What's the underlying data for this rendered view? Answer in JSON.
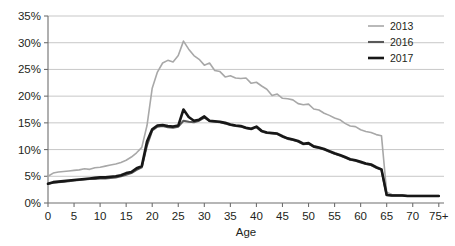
{
  "chart_data": {
    "type": "line",
    "title": "",
    "xlabel": "Age",
    "ylabel": "",
    "xlim": [
      0,
      76
    ],
    "ylim": [
      0,
      35
    ],
    "grid": true,
    "legend_position": "top-right",
    "y_ticks": [
      "0%",
      "5%",
      "10%",
      "15%",
      "20%",
      "25%",
      "30%",
      "35%"
    ],
    "y_tick_values": [
      0,
      5,
      10,
      15,
      20,
      25,
      30,
      35
    ],
    "x_ticks": [
      "0",
      "5",
      "10",
      "15",
      "20",
      "25",
      "30",
      "35",
      "40",
      "45",
      "50",
      "55",
      "60",
      "65",
      "70",
      "75+"
    ],
    "x_tick_values": [
      0,
      5,
      10,
      15,
      20,
      25,
      30,
      35,
      40,
      45,
      50,
      55,
      60,
      65,
      70,
      75
    ],
    "x": [
      0,
      1,
      2,
      3,
      4,
      5,
      6,
      7,
      8,
      9,
      10,
      11,
      12,
      13,
      14,
      15,
      16,
      17,
      18,
      19,
      20,
      21,
      22,
      23,
      24,
      25,
      26,
      27,
      28,
      29,
      30,
      31,
      32,
      33,
      34,
      35,
      36,
      37,
      38,
      39,
      40,
      41,
      42,
      43,
      44,
      45,
      46,
      47,
      48,
      49,
      50,
      51,
      52,
      53,
      54,
      55,
      56,
      57,
      58,
      59,
      60,
      61,
      62,
      63,
      64,
      65,
      66,
      67,
      68,
      69,
      70,
      71,
      72,
      73,
      74,
      75
    ],
    "series": [
      {
        "name": "2013",
        "color": "#a8a8a8",
        "width": 1.6,
        "values": [
          5.0,
          5.6,
          5.8,
          5.9,
          6.0,
          6.1,
          6.2,
          6.4,
          6.3,
          6.6,
          6.7,
          6.9,
          7.1,
          7.3,
          7.6,
          8.0,
          8.6,
          9.4,
          10.4,
          14.5,
          21.5,
          24.5,
          26.2,
          26.7,
          26.4,
          27.6,
          30.3,
          28.8,
          27.6,
          26.9,
          25.8,
          26.2,
          24.8,
          24.6,
          23.6,
          23.8,
          23.4,
          23.3,
          23.4,
          22.4,
          22.6,
          21.9,
          21.3,
          20.1,
          20.4,
          19.6,
          19.5,
          19.3,
          18.6,
          18.4,
          18.5,
          17.6,
          17.4,
          16.8,
          16.4,
          15.9,
          15.6,
          14.9,
          14.4,
          14.3,
          13.7,
          13.4,
          13.2,
          12.8,
          12.6,
          2.0,
          1.6,
          1.5,
          1.5,
          1.4,
          1.4,
          1.4,
          1.4,
          1.4,
          1.4,
          1.4
        ]
      },
      {
        "name": "2016",
        "color": "#595959",
        "width": 2.1,
        "values": [
          3.6,
          3.8,
          3.9,
          4.0,
          4.1,
          4.2,
          4.3,
          4.4,
          4.5,
          4.5,
          4.6,
          4.6,
          4.7,
          4.8,
          5.0,
          5.3,
          5.6,
          6.2,
          6.7,
          10.8,
          13.6,
          14.3,
          14.4,
          14.2,
          14.1,
          14.3,
          15.4,
          15.2,
          15.1,
          15.4,
          16.0,
          15.3,
          15.2,
          15.1,
          14.9,
          14.6,
          14.4,
          14.3,
          14.0,
          13.8,
          14.2,
          13.4,
          13.1,
          13.0,
          12.9,
          12.4,
          12.0,
          11.8,
          11.5,
          11.0,
          11.1,
          10.5,
          10.3,
          10.0,
          9.6,
          9.2,
          8.9,
          8.5,
          8.1,
          7.9,
          7.6,
          7.3,
          7.1,
          6.6,
          6.2,
          1.5,
          1.4,
          1.4,
          1.4,
          1.3,
          1.3,
          1.3,
          1.3,
          1.3,
          1.3,
          1.3
        ]
      },
      {
        "name": "2017",
        "color": "#171717",
        "width": 2.6,
        "values": [
          3.6,
          3.9,
          4.0,
          4.1,
          4.2,
          4.3,
          4.4,
          4.5,
          4.6,
          4.7,
          4.8,
          4.8,
          4.9,
          5.0,
          5.2,
          5.6,
          5.8,
          6.5,
          6.9,
          11.5,
          13.8,
          14.5,
          14.6,
          14.4,
          14.3,
          14.5,
          17.5,
          16.1,
          15.4,
          15.6,
          16.2,
          15.4,
          15.3,
          15.2,
          15.0,
          14.7,
          14.5,
          14.4,
          14.1,
          13.9,
          14.3,
          13.5,
          13.2,
          13.1,
          13.0,
          12.5,
          12.1,
          11.9,
          11.6,
          11.1,
          11.2,
          10.6,
          10.4,
          10.1,
          9.7,
          9.3,
          9.0,
          8.6,
          8.2,
          8.0,
          7.7,
          7.4,
          7.2,
          6.7,
          6.3,
          1.5,
          1.4,
          1.4,
          1.4,
          1.3,
          1.3,
          1.3,
          1.3,
          1.3,
          1.3,
          1.3
        ]
      }
    ]
  }
}
